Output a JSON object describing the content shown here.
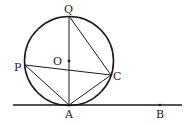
{
  "diagram": {
    "type": "geometry",
    "circle": {
      "center_label": "O",
      "cx": 69,
      "cy": 61,
      "r": 45
    },
    "points": {
      "Q": {
        "label": "Q",
        "x": 69,
        "y": 16
      },
      "A": {
        "label": "A",
        "x": 69,
        "y": 105
      },
      "P": {
        "label": "P",
        "x": 25,
        "y": 65
      },
      "C": {
        "label": "C",
        "x": 111,
        "y": 75
      },
      "O": {
        "label": "O",
        "x": 69,
        "y": 61
      },
      "B": {
        "label": "B",
        "x": 160,
        "y": 105
      }
    },
    "segments": [
      "QA",
      "QC",
      "PC",
      "PA",
      "AC"
    ],
    "tangent_line": {
      "through": [
        "A",
        "B"
      ],
      "x1": 13,
      "x2": 182,
      "y": 105
    },
    "colors": {
      "stroke": "#1a1a1a",
      "background": "#ffffff"
    }
  }
}
